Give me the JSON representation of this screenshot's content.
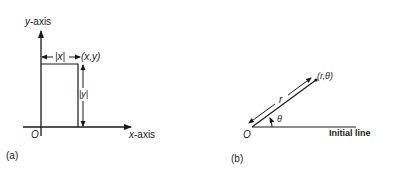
{
  "panel_a": {
    "label": "(a)",
    "y_axis_label": "y-axis",
    "x_axis_label": "x-axis",
    "origin_label": "O",
    "abs_x_label": "|x|",
    "point_label": "(x,y)",
    "abs_y_label": "|y|"
  },
  "panel_b": {
    "label": "(b)",
    "origin_label": "O",
    "point_label": "(r,θ)",
    "radius_label": "r",
    "angle_label": "θ",
    "initial_line_label": "Initial line"
  }
}
